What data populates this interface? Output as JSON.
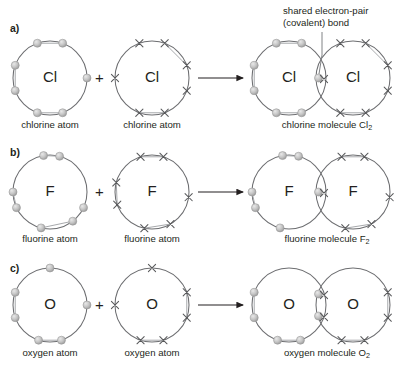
{
  "figure": {
    "background": "#ffffff",
    "ink": "#231f20",
    "ring_color": "#6d6e71",
    "dot_color": "#b3b3b3",
    "cross_color": "#58595b"
  },
  "annotation": {
    "line1": "shared electron-pair",
    "line2": "(covalent) bond",
    "target": "overlap-region-of-chlorine-molecule"
  },
  "operators": {
    "plus": "+",
    "arrow": "→"
  },
  "rows": [
    {
      "id": "a",
      "label": "a)",
      "element": "Cl",
      "valence_electrons": 7,
      "bond_order": 1,
      "left": {
        "symbol": "Cl",
        "caption": "chlorine atom",
        "marker": "dot",
        "electron_count": 7,
        "angles": [
          250,
          290,
          160,
          200,
          70,
          110,
          0
        ]
      },
      "right": {
        "symbol": "Cl",
        "caption": "chlorine atom",
        "marker": "cross",
        "electron_count": 7,
        "angles": [
          250,
          290,
          180,
          70,
          110,
          340,
          20
        ]
      },
      "molecule": {
        "symbol_left": "Cl",
        "symbol_right": "Cl",
        "caption_text": "chlorine molecule Cl",
        "caption_sub": "2",
        "shared_pairs": 1,
        "lone_dots": 6,
        "lone_crosses": 6
      }
    },
    {
      "id": "b",
      "label": "b)",
      "element": "F",
      "valence_electrons": 7,
      "bond_order": 1,
      "left": {
        "symbol": "F",
        "caption": "fluorine atom",
        "marker": "dot",
        "electron_count": 7,
        "angles": [
          256,
          308,
          180,
          205,
          75,
          100,
          335
        ]
      },
      "right": {
        "symbol": "F",
        "caption": "fluorine atom",
        "marker": "cross",
        "electron_count": 7,
        "angles": [
          258,
          300,
          165,
          200,
          72,
          108,
          352
        ]
      },
      "molecule": {
        "symbol_left": "F",
        "symbol_right": "F",
        "caption_text": "fluorine molecule F",
        "caption_sub": "2",
        "shared_pairs": 1,
        "lone_dots": 6,
        "lone_crosses": 6
      }
    },
    {
      "id": "c",
      "label": "c)",
      "element": "O",
      "valence_electrons": 6,
      "bond_order": 2,
      "left": {
        "symbol": "O",
        "caption": "oxygen atom",
        "marker": "dot",
        "electron_count": 6,
        "angles": [
          252,
          288,
          160,
          200,
          0,
          90
        ]
      },
      "right": {
        "symbol": "O",
        "caption": "oxygen atom",
        "marker": "cross",
        "electron_count": 6,
        "angles": [
          252,
          288,
          180,
          340,
          20,
          90
        ]
      },
      "molecule": {
        "symbol_left": "O",
        "symbol_right": "O",
        "caption_text": "oxygen molecule O",
        "caption_sub": "2",
        "shared_pairs": 2,
        "lone_dots": 4,
        "lone_crosses": 4
      }
    }
  ],
  "geometry": {
    "rows_y": [
      78,
      192,
      305
    ],
    "radius": 37,
    "left_cx": 50,
    "right_cx": 152,
    "mol_left_cx": 289,
    "mol_right_cx": 353,
    "plus_x": 99,
    "arrow_x1": 198,
    "arrow_x2": 243
  }
}
